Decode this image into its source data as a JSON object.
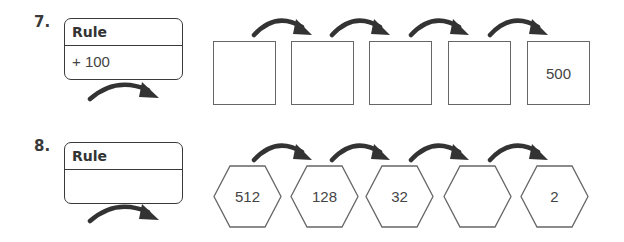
{
  "problems": [
    {
      "number": "7.",
      "rule_label": "Rule",
      "rule_value": "+ 100",
      "shape": "square",
      "cells": [
        "",
        "",
        "",
        "",
        "500"
      ]
    },
    {
      "number": "8.",
      "rule_label": "Rule",
      "rule_value": "",
      "shape": "hexagon",
      "cells": [
        "512",
        "128",
        "32",
        "",
        "2"
      ]
    }
  ],
  "icons": {
    "arrow": "curved-arrow-right-icon"
  },
  "colors": {
    "arrow": "#333333",
    "border": "#3a3a3a",
    "cell_border": "#666666"
  }
}
